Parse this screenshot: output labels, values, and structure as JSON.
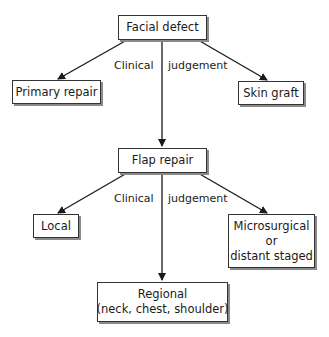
{
  "diagram": {
    "type": "flowchart",
    "nodes": {
      "facial_defect": {
        "label": "Facial defect"
      },
      "primary_repair": {
        "label": "Primary repair"
      },
      "skin_graft": {
        "label": "Skin graft"
      },
      "flap_repair": {
        "label": "Flap repair"
      },
      "local": {
        "label": "Local"
      },
      "microsurgical": {
        "line1": "Microsurgical",
        "line2": "or",
        "line3": "distant staged"
      },
      "regional": {
        "line1": "Regional",
        "line2": "(neck, chest, shoulder)"
      }
    },
    "edge_labels": {
      "top_left": "Clinical",
      "top_right": "judgement",
      "bottom_left": "Clinical",
      "bottom_right": "judgement"
    },
    "edges": [
      {
        "from": "Facial defect",
        "to": "Primary repair"
      },
      {
        "from": "Facial defect",
        "to": "Flap repair"
      },
      {
        "from": "Facial defect",
        "to": "Skin graft"
      },
      {
        "from": "Flap repair",
        "to": "Local"
      },
      {
        "from": "Flap repair",
        "to": "Regional"
      },
      {
        "from": "Flap repair",
        "to": "Microsurgical or distant staged"
      }
    ],
    "colors": {
      "line": "#1a1a1a",
      "box_border": "#333333",
      "shadow": "#8a8a8a"
    }
  }
}
